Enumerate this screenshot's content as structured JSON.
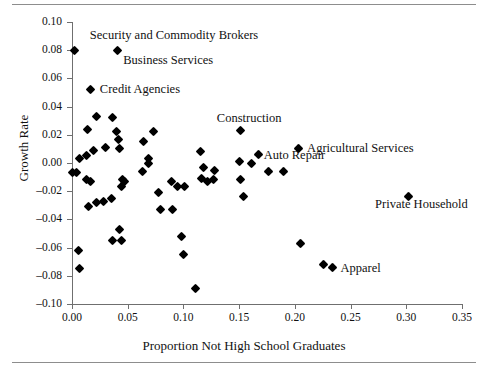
{
  "figure": {
    "has_top_rule": true,
    "has_bottom_rule": true,
    "rule_color": "#8d8d8d",
    "marker_color": "#000000",
    "axis_color": "#6f6f6f",
    "background": "#ffffff"
  },
  "chart_data": {
    "type": "scatter",
    "title": "",
    "xlabel": "Proportion Not High School Graduates",
    "ylabel": "Growth Rate",
    "xlim": [
      0.0,
      0.35
    ],
    "ylim": [
      -0.1,
      0.1
    ],
    "xticks": [
      0.0,
      0.05,
      0.1,
      0.15,
      0.2,
      0.25,
      0.3,
      0.35
    ],
    "xticklabels": [
      "0.00",
      "0.05",
      "0.10",
      "0.15",
      "0.20",
      "0.25",
      "0.30",
      "0.35"
    ],
    "yticks": [
      -0.1,
      -0.08,
      -0.06,
      -0.04,
      -0.02,
      0.0,
      0.02,
      0.04,
      0.06,
      0.08,
      0.1
    ],
    "yticklabels": [
      "-0.10",
      "-0.08",
      "-0.06",
      "-0.04",
      "-0.02",
      "0.00",
      "0.02",
      "0.04",
      "0.06",
      "0.08",
      "0.10"
    ],
    "grid": false,
    "legend": false,
    "marker": "diamond",
    "points": [
      {
        "x": 0.002,
        "y": 0.08,
        "label": "Security and Commodity Brokers"
      },
      {
        "x": 0.041,
        "y": 0.08,
        "label": "Business Services"
      },
      {
        "x": 0.017,
        "y": 0.052,
        "label": "Credit Agencies"
      },
      {
        "x": 0.022,
        "y": 0.033
      },
      {
        "x": 0.036,
        "y": 0.032
      },
      {
        "x": 0.014,
        "y": 0.024
      },
      {
        "x": 0.04,
        "y": 0.022
      },
      {
        "x": 0.073,
        "y": 0.022
      },
      {
        "x": 0.042,
        "y": 0.017
      },
      {
        "x": 0.151,
        "y": 0.023,
        "label": "Construction"
      },
      {
        "x": 0.064,
        "y": 0.015
      },
      {
        "x": 0.03,
        "y": 0.011
      },
      {
        "x": 0.043,
        "y": 0.01
      },
      {
        "x": 0.019,
        "y": 0.009
      },
      {
        "x": 0.115,
        "y": 0.008
      },
      {
        "x": 0.203,
        "y": 0.01,
        "label": "Agricultural Services"
      },
      {
        "x": 0.167,
        "y": 0.006,
        "label": "Auto Repair"
      },
      {
        "x": 0.013,
        "y": 0.005
      },
      {
        "x": 0.069,
        "y": 0.003
      },
      {
        "x": 0.007,
        "y": 0.003
      },
      {
        "x": 0.069,
        "y": 0.0
      },
      {
        "x": 0.15,
        "y": 0.001
      },
      {
        "x": 0.161,
        "y": 0.0
      },
      {
        "x": 0.004,
        "y": -0.007
      },
      {
        "x": 0.0,
        "y": -0.007
      },
      {
        "x": 0.118,
        "y": -0.003
      },
      {
        "x": 0.128,
        "y": -0.005
      },
      {
        "x": 0.063,
        "y": -0.006
      },
      {
        "x": 0.176,
        "y": -0.006
      },
      {
        "x": 0.19,
        "y": -0.006
      },
      {
        "x": 0.013,
        "y": -0.012
      },
      {
        "x": 0.017,
        "y": -0.013
      },
      {
        "x": 0.045,
        "y": -0.012
      },
      {
        "x": 0.047,
        "y": -0.013
      },
      {
        "x": 0.116,
        "y": -0.011
      },
      {
        "x": 0.122,
        "y": -0.013
      },
      {
        "x": 0.127,
        "y": -0.012
      },
      {
        "x": 0.089,
        "y": -0.013
      },
      {
        "x": 0.151,
        "y": -0.012
      },
      {
        "x": 0.044,
        "y": -0.017
      },
      {
        "x": 0.095,
        "y": -0.017
      },
      {
        "x": 0.101,
        "y": -0.017
      },
      {
        "x": 0.078,
        "y": -0.021
      },
      {
        "x": 0.154,
        "y": -0.024
      },
      {
        "x": 0.302,
        "y": -0.024,
        "label": "Private Household"
      },
      {
        "x": 0.015,
        "y": -0.031
      },
      {
        "x": 0.022,
        "y": -0.028
      },
      {
        "x": 0.028,
        "y": -0.027
      },
      {
        "x": 0.035,
        "y": -0.025
      },
      {
        "x": 0.079,
        "y": -0.033
      },
      {
        "x": 0.09,
        "y": -0.033
      },
      {
        "x": 0.043,
        "y": -0.047
      },
      {
        "x": 0.098,
        "y": -0.052
      },
      {
        "x": 0.036,
        "y": -0.055
      },
      {
        "x": 0.044,
        "y": -0.055
      },
      {
        "x": 0.006,
        "y": -0.062
      },
      {
        "x": 0.1,
        "y": -0.065
      },
      {
        "x": 0.205,
        "y": -0.057
      },
      {
        "x": 0.007,
        "y": -0.075
      },
      {
        "x": 0.226,
        "y": -0.072
      },
      {
        "x": 0.234,
        "y": -0.074,
        "label": "Apparel"
      },
      {
        "x": 0.111,
        "y": -0.089
      }
    ],
    "annotations": [
      {
        "text": "Security and Commodity Brokers",
        "anchor_x": 0.016,
        "anchor_y": 0.09
      },
      {
        "text": "Business Services",
        "anchor_x": 0.046,
        "anchor_y": 0.072
      },
      {
        "text": "Credit Agencies",
        "anchor_x": 0.025,
        "anchor_y": 0.052
      },
      {
        "text": "Construction",
        "anchor_x": 0.13,
        "anchor_y": 0.031
      },
      {
        "text": "Agricultural Services",
        "anchor_x": 0.211,
        "anchor_y": 0.01
      },
      {
        "text": "Auto Repair",
        "anchor_x": 0.172,
        "anchor_y": 0.005
      },
      {
        "text": "Private Household",
        "anchor_x": 0.272,
        "anchor_y": -0.03
      },
      {
        "text": "Apparel",
        "anchor_x": 0.241,
        "anchor_y": -0.075
      }
    ]
  }
}
